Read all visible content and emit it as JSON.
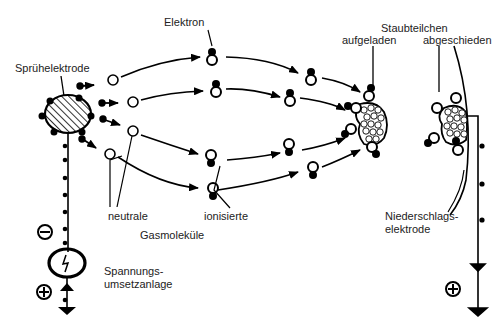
{
  "diagram": {
    "labels": {
      "electron": "Elektron",
      "spray_electrode": "Sprühelektrode",
      "dust_particles": "Staubteilchen",
      "charged": "aufgeladen",
      "deposited": "abgeschieden",
      "neutral": "neutrale",
      "ionized": "ionisierte",
      "gas_molecules": "Gasmoleküle",
      "collector_line1": "Niederschlags-",
      "collector_line2": "elektrode",
      "power_line1": "Spannungs-",
      "power_line2": "umsetzanlage"
    },
    "symbols": {
      "minus": "minus-sign",
      "plus_left": "plus-sign",
      "plus_right": "plus-sign",
      "power_source": "lightning-icon"
    },
    "colors": {
      "stroke": "#000000",
      "background": "#ffffff",
      "text": "#222222"
    }
  }
}
